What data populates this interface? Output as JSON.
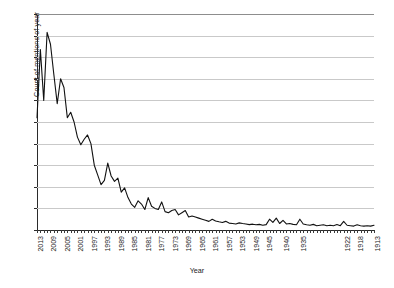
{
  "chart_data": {
    "type": "line",
    "title": "",
    "xlabel": "Year",
    "ylabel": "Count of mentions of year",
    "ylim": [
      0,
      1000
    ],
    "ytick_labels": [
      "0",
      "100",
      "200",
      "300",
      "400",
      "500",
      "600",
      "700",
      "800",
      "900",
      "1,000"
    ],
    "ytick_values": [
      0,
      100,
      200,
      300,
      400,
      500,
      600,
      700,
      800,
      900,
      1000
    ],
    "grid": true,
    "legend": null,
    "x_order": "descending",
    "xtick_labels": [
      "2013",
      "2009",
      "2005",
      "2001",
      "1997",
      "1993",
      "1989",
      "1985",
      "1981",
      "1977",
      "1973",
      "1969",
      "1965",
      "1961",
      "1957",
      "1953",
      "1949",
      "1945",
      "1940",
      "1935",
      "1922",
      "1918",
      "1913"
    ],
    "line_color": "#111111",
    "grid_color": "#c9c9c9",
    "categories": [
      "2013",
      "2012",
      "2011",
      "2010",
      "2009",
      "2008",
      "2007",
      "2006",
      "2005",
      "2004",
      "2003",
      "2002",
      "2001",
      "2000",
      "1999",
      "1998",
      "1997",
      "1996",
      "1995",
      "1994",
      "1993",
      "1992",
      "1991",
      "1990",
      "1989",
      "1988",
      "1987",
      "1986",
      "1985",
      "1984",
      "1983",
      "1982",
      "1981",
      "1980",
      "1979",
      "1978",
      "1977",
      "1976",
      "1975",
      "1974",
      "1973",
      "1972",
      "1971",
      "1970",
      "1969",
      "1968",
      "1967",
      "1966",
      "1965",
      "1964",
      "1963",
      "1962",
      "1961",
      "1960",
      "1959",
      "1958",
      "1957",
      "1956",
      "1955",
      "1954",
      "1953",
      "1952",
      "1951",
      "1950",
      "1949",
      "1948",
      "1947",
      "1946",
      "1945",
      "1944",
      "1943",
      "1942",
      "1941",
      "1940",
      "1939",
      "1938",
      "1937",
      "1936",
      "1935",
      "1934",
      "1933",
      "1932",
      "1931",
      "1930",
      "1929",
      "1928",
      "1927",
      "1926",
      "1925",
      "1924",
      "1923",
      "1922",
      "1921",
      "1920",
      "1919",
      "1918",
      "1917",
      "1916",
      "1915",
      "1914",
      "1913"
    ],
    "values": [
      520,
      835,
      600,
      915,
      860,
      720,
      585,
      700,
      660,
      520,
      545,
      500,
      430,
      395,
      420,
      440,
      400,
      300,
      255,
      210,
      230,
      310,
      250,
      225,
      240,
      175,
      195,
      150,
      120,
      105,
      135,
      120,
      95,
      150,
      110,
      100,
      95,
      130,
      85,
      80,
      90,
      95,
      70,
      80,
      90,
      60,
      65,
      60,
      55,
      50,
      45,
      40,
      50,
      42,
      38,
      35,
      40,
      32,
      30,
      28,
      33,
      30,
      28,
      25,
      27,
      24,
      26,
      22,
      25,
      50,
      35,
      55,
      30,
      45,
      28,
      30,
      26,
      24,
      50,
      28,
      24,
      22,
      26,
      20,
      22,
      24,
      20,
      22,
      20,
      25,
      20,
      40,
      22,
      20,
      18,
      24,
      20,
      18,
      20,
      18,
      22
    ]
  }
}
